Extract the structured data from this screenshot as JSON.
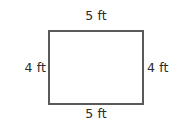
{
  "figure": {
    "kind": "rectangle-dimension-diagram",
    "unit": "ft",
    "stroke_color": "#595959",
    "text_color": "#2b2b2b",
    "background_color": "#ffffff",
    "labels": {
      "top": "5 ft",
      "bottom": "5 ft",
      "left": "4 ft",
      "right": "4 ft"
    }
  },
  "chart_data": {
    "type": "diagram",
    "title": "",
    "shape": "rectangle",
    "unit": "ft",
    "sides": [
      {
        "position": "top",
        "label": "5 ft",
        "value": 5
      },
      {
        "position": "right",
        "label": "4 ft",
        "value": 4
      },
      {
        "position": "bottom",
        "label": "5 ft",
        "value": 5
      },
      {
        "position": "left",
        "label": "4 ft",
        "value": 4
      }
    ],
    "width": 5,
    "height": 4,
    "perimeter": 18,
    "area": 20
  }
}
